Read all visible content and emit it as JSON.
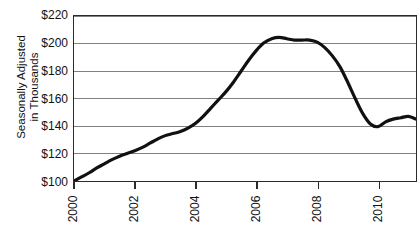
{
  "chart_data": {
    "type": "line",
    "title": "",
    "xlabel": "",
    "ylabel": "Seasonally Adjusted in Thousands",
    "ylabel_lines": [
      "Seasonally Adjusted",
      "in Thousands"
    ],
    "xlim": [
      2000,
      2011.25
    ],
    "ylim": [
      100,
      220
    ],
    "ytick_values": [
      220,
      200,
      180,
      160,
      140,
      120,
      100
    ],
    "ytick_labels": [
      "$220",
      "$200",
      "$180",
      "$160",
      "$140",
      "$120",
      "$100"
    ],
    "xtick_values": [
      2000,
      2002,
      2004,
      2006,
      2008,
      2010
    ],
    "xtick_labels": [
      "2000",
      "2002",
      "2004",
      "2006",
      "2008",
      "2010"
    ],
    "grid": "horizontal",
    "legend": "none",
    "line_color": "#111111",
    "line_width": 3.2,
    "frame_color": "#2b2b2b",
    "grid_color": "#808080",
    "background": "#ffffff",
    "series": [
      {
        "name": "Seasonally Adjusted Value",
        "x": [
          2000.0,
          2000.25,
          2000.5,
          2000.75,
          2001.0,
          2001.25,
          2001.5,
          2001.75,
          2002.0,
          2002.25,
          2002.5,
          2002.75,
          2003.0,
          2003.25,
          2003.5,
          2003.75,
          2004.0,
          2004.25,
          2004.5,
          2004.75,
          2005.0,
          2005.25,
          2005.5,
          2005.75,
          2006.0,
          2006.25,
          2006.5,
          2006.75,
          2007.0,
          2007.25,
          2007.5,
          2007.75,
          2008.0,
          2008.25,
          2008.5,
          2008.75,
          2009.0,
          2009.25,
          2009.5,
          2009.75,
          2010.0,
          2010.25,
          2010.5,
          2010.75,
          2011.0,
          2011.25
        ],
        "y": [
          100.0,
          103.0,
          106.0,
          109.5,
          112.5,
          115.5,
          118.0,
          120.0,
          122.0,
          124.5,
          127.5,
          130.5,
          133.0,
          134.5,
          136.0,
          138.5,
          142.0,
          147.0,
          153.0,
          159.0,
          165.0,
          172.0,
          180.0,
          188.0,
          195.0,
          200.5,
          203.5,
          204.5,
          203.5,
          202.5,
          202.5,
          202.5,
          201.0,
          197.0,
          191.0,
          183.0,
          172.0,
          160.0,
          149.0,
          141.5,
          139.5,
          143.0,
          145.0,
          146.0,
          147.0,
          145.0
        ]
      }
    ]
  }
}
